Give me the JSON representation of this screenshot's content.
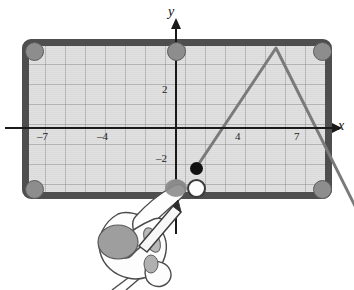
{
  "figure": {
    "kind": "graphing-tablet-illustration"
  },
  "device": {
    "frame_color": "#4e4e4e",
    "screen_color": "#dcdcdc",
    "screw_color": "#8d8d8d",
    "screws": [
      {
        "name": "screw-top-left"
      },
      {
        "name": "screw-top-center"
      },
      {
        "name": "screw-top-right"
      },
      {
        "name": "screw-bottom-left"
      },
      {
        "name": "screw-bottom-center"
      },
      {
        "name": "screw-bottom-right"
      }
    ]
  },
  "axes": {
    "x_axis_label": "x",
    "y_axis_label": "y",
    "x_tick_labels": [
      "–7",
      "–4",
      "4",
      "7"
    ],
    "y_tick_labels": [
      "2",
      "–2"
    ],
    "grid": "on",
    "axis_color": "#1a1a1a"
  },
  "chart_data": {
    "type": "line",
    "title": "",
    "xlabel": "x",
    "ylabel": "y",
    "xlim": [
      -9.5,
      9.5
    ],
    "ylim": [
      -4.5,
      4.5
    ],
    "grid": true,
    "legend": "none",
    "series": [
      {
        "name": "piecewise-linear-graph",
        "x": [
          1,
          5,
          9
        ],
        "y": [
          -2,
          4,
          -4
        ],
        "color": "#7a7a7a"
      }
    ],
    "annotations": [
      {
        "name": "closed-point",
        "x": 1,
        "y": -2,
        "style": "filled-circle",
        "color": "#111111"
      },
      {
        "name": "cursor-point",
        "x": 1,
        "y": -3,
        "style": "open-circle",
        "color": "#fdfdfd"
      }
    ],
    "x_ticks": [
      -7,
      -4,
      4,
      7
    ],
    "x_tick_labels": [
      "–7",
      "–4",
      "4",
      "7"
    ],
    "y_ticks": [
      2,
      -2
    ],
    "y_tick_labels": [
      "2",
      "–2"
    ]
  },
  "colors": {
    "graph_line": "#7a7a7a",
    "grid_line": "#78787d",
    "frame": "#4e4e4e",
    "screen": "#dcdcdc",
    "ink": "#1a1a1a"
  },
  "hand": {
    "name": "hand-holding-stylus",
    "skin_color": "#fbfbfb",
    "outline_color": "#4a4a4a",
    "shadow_color": "#9a9a9a"
  }
}
